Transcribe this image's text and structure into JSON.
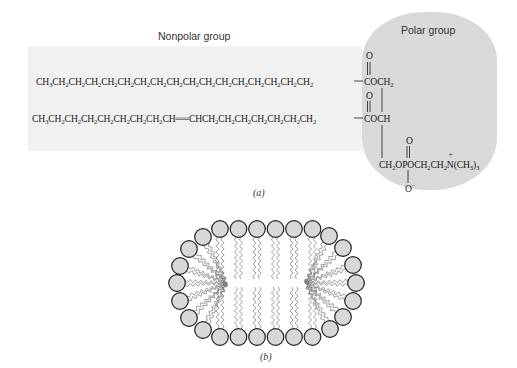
{
  "figure": {
    "panel_a": {
      "caption": "(a)",
      "nonpolar_label": "Nonpolar group",
      "polar_label": "Polar group",
      "chain1": [
        "CH",
        "3",
        "CH",
        "2",
        "CH",
        "2",
        "CH",
        "2",
        "CH",
        "2",
        "CH",
        "2",
        "CH",
        "2",
        "CH",
        "2",
        "CH",
        "2",
        "CH",
        "2",
        "CH",
        "2",
        "CH",
        "2",
        "CH",
        "2",
        "CH",
        "2",
        "CH",
        "2",
        "CH",
        "2",
        "CH",
        "2"
      ],
      "chain1_text": "CH3CH2CH2CH2CH2CH2CH2CH2CH2CH2CH2CH2CH2CH2CH2CH2CH2",
      "chain2_text": "CH3CH2CH2CH2CH2CH2CH2CH2CH=CHCH2CH2CH2CH2CH2CH2CH2",
      "chain2_double_bond": "=",
      "ester1": {
        "carbonyl_o": "O",
        "group": "COCH",
        "sub": "2"
      },
      "ester2": {
        "carbonyl_o": "O",
        "group": "COCH"
      },
      "phosphate": {
        "prefix": "CH",
        "prefix_sub": "2",
        "middle": "OPOCH",
        "mid_sub1": "2",
        "ch": "CH",
        "mid_sub2": "2",
        "nitrogen": "N",
        "nitrogen_charge": "+",
        "methyl": "(CH",
        "methyl_sub": "3",
        "methyl_close": ")",
        "methyl_count": "3",
        "top_o": "O",
        "bottom_o": "O",
        "bottom_charge": "−"
      }
    },
    "panel_b": {
      "caption": "(b)",
      "description": "Micelle/bilayer vesicle cross-section with polar heads (circles) and zigzag hydrocarbon tails",
      "head_count": 26,
      "head_fill": "#d8d8d8",
      "head_stroke": "#222222",
      "tail_color": "#777777"
    },
    "colors": {
      "nonpolar_bg": "#f1f1f1",
      "polar_bg": "#d9d9d9",
      "text": "#1a1a1a"
    }
  }
}
